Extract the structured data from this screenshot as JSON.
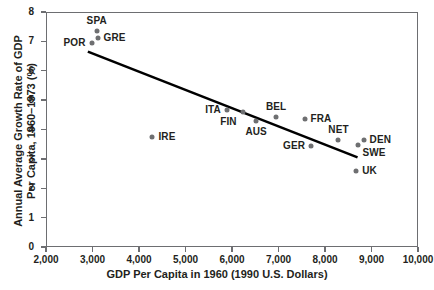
{
  "chart_data": {
    "type": "scatter",
    "title": "",
    "xlabel": "GDP Per Capita in 1960 (1990 U.S. Dollars)",
    "ylabel": "Annual Average Growth Rate of GDP Per Capita, 1960–1973 (%)",
    "ylabel_line1": "Annual Average Growth Rate of GDP",
    "ylabel_line2": "Per Capita, 1960–1973 (%)",
    "xlim": [
      2000,
      10000
    ],
    "ylim": [
      0,
      8
    ],
    "grid": false,
    "legend": "none",
    "xticks": [
      2000,
      3000,
      4000,
      5000,
      6000,
      7000,
      8000,
      9000,
      10000
    ],
    "xtick_labels": [
      "2,000",
      "3,000",
      "4,000",
      "5,000",
      "6,000",
      "7,000",
      "8,000",
      "9,000",
      "10,000"
    ],
    "yticks": [
      0,
      1,
      2,
      3,
      4,
      5,
      6,
      7,
      8
    ],
    "ytick_labels": [
      "0",
      "1",
      "2",
      "3",
      "4",
      "5",
      "6",
      "7",
      "8"
    ],
    "marker_color": "#6e6f71",
    "line_color": "#000000",
    "axis_color": "#6d6e71",
    "points": [
      {
        "label": "POR",
        "x": 2980,
        "y": 6.95,
        "label_pos": "left"
      },
      {
        "label": "SPA",
        "x": 3090,
        "y": 7.35,
        "label_pos": "above"
      },
      {
        "label": "GRE",
        "x": 3110,
        "y": 7.1,
        "label_pos": "right"
      },
      {
        "label": "IRE",
        "x": 4290,
        "y": 3.73,
        "label_pos": "right"
      },
      {
        "label": "ITA",
        "x": 5890,
        "y": 4.68,
        "label_pos": "left"
      },
      {
        "label": "FIN",
        "x": 6230,
        "y": 4.58,
        "label_pos": "below-left"
      },
      {
        "label": "AUS",
        "x": 6520,
        "y": 4.3,
        "label_pos": "below"
      },
      {
        "label": "BEL",
        "x": 6950,
        "y": 4.44,
        "label_pos": "above"
      },
      {
        "label": "FRA",
        "x": 7560,
        "y": 4.37,
        "label_pos": "right"
      },
      {
        "label": "GER",
        "x": 7700,
        "y": 3.45,
        "label_pos": "left"
      },
      {
        "label": "NET",
        "x": 8290,
        "y": 3.64,
        "label_pos": "above"
      },
      {
        "label": "UK",
        "x": 8670,
        "y": 2.6,
        "label_pos": "right"
      },
      {
        "label": "SWE",
        "x": 8700,
        "y": 3.48,
        "label_pos": "below-right"
      },
      {
        "label": "DEN",
        "x": 8830,
        "y": 3.65,
        "label_pos": "right"
      }
    ],
    "trendline": {
      "x_start": 2900,
      "y_start": 6.65,
      "x_end": 8700,
      "y_end": 3.05
    }
  }
}
